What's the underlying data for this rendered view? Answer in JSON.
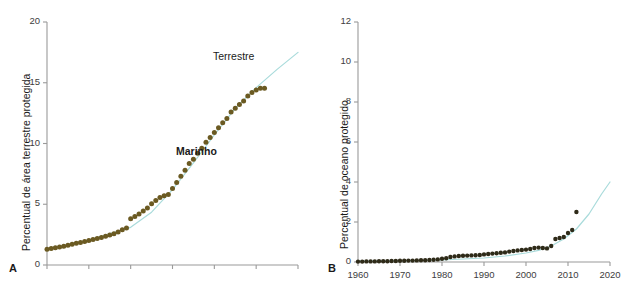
{
  "chart_data": [
    {
      "panel": "A",
      "type": "scatter",
      "title": "",
      "xlabel": "",
      "ylabel": "Percentual de área terrestre protegida",
      "series_label": "Terrestre",
      "xlim": [
        1960,
        2020
      ],
      "ylim": [
        0,
        20
      ],
      "yticks": [
        0,
        5,
        10,
        15,
        20
      ],
      "ytick_labels": [
        "0",
        "5",
        "10",
        "15",
        "20"
      ],
      "xticks": [
        1960,
        1970,
        1980,
        1990,
        2000,
        2010,
        2020
      ],
      "xtick_labels": [
        "",
        "",
        "",
        "",
        "",
        "",
        ""
      ],
      "grid": false,
      "legend": "none",
      "point_color": "#6b5a22",
      "fit_color": "#a9dbdb",
      "x": [
        1960,
        1961,
        1962,
        1963,
        1964,
        1965,
        1966,
        1967,
        1968,
        1969,
        1970,
        1971,
        1972,
        1973,
        1974,
        1975,
        1976,
        1977,
        1978,
        1979,
        1980,
        1981,
        1982,
        1983,
        1984,
        1985,
        1986,
        1987,
        1988,
        1989,
        1990,
        1991,
        1992,
        1993,
        1994,
        1995,
        1996,
        1997,
        1998,
        1999,
        2000,
        2001,
        2002,
        2003,
        2004,
        2005,
        2006,
        2007,
        2008,
        2009,
        2010,
        2011,
        2012
      ],
      "y": [
        1.3,
        1.36,
        1.42,
        1.48,
        1.55,
        1.62,
        1.7,
        1.78,
        1.86,
        1.94,
        2.02,
        2.1,
        2.18,
        2.27,
        2.36,
        2.46,
        2.58,
        2.72,
        2.9,
        3.05,
        3.8,
        4.0,
        4.2,
        4.45,
        4.7,
        5.05,
        5.3,
        5.55,
        5.7,
        5.8,
        6.3,
        6.8,
        7.3,
        7.8,
        8.35,
        8.7,
        9.2,
        9.6,
        10.1,
        10.5,
        10.9,
        11.3,
        11.7,
        12.05,
        12.6,
        12.9,
        13.2,
        13.5,
        13.9,
        14.2,
        14.4,
        14.55,
        14.55
      ],
      "fit_x": [
        1960,
        1970,
        1980,
        1985,
        1990,
        1995,
        2000,
        2005,
        2010,
        2015,
        2020
      ],
      "fit_y": [
        1.35,
        2.05,
        3.1,
        4.35,
        6.2,
        8.4,
        10.7,
        12.9,
        14.6,
        16.1,
        17.5
      ]
    },
    {
      "panel": "B",
      "type": "scatter",
      "title": "",
      "xlabel": "",
      "ylabel": "Percentual de oceano protegido",
      "series_label": "Marinho",
      "xlim": [
        1960,
        2020
      ],
      "ylim": [
        0,
        12
      ],
      "yticks": [
        0,
        2,
        4,
        6,
        8,
        10,
        12
      ],
      "ytick_labels": [
        "0",
        "2",
        "4",
        "6",
        "8",
        "10",
        "12"
      ],
      "xticks": [
        1960,
        1970,
        1980,
        1990,
        2000,
        2010,
        2020
      ],
      "xtick_labels": [
        "1960",
        "1970",
        "1980",
        "1990",
        "2000",
        "2010",
        "2020"
      ],
      "grid": false,
      "legend": "none",
      "point_color": "#2e2a18",
      "fit_color": "#a9dbdb",
      "x": [
        1960,
        1961,
        1962,
        1963,
        1964,
        1965,
        1966,
        1967,
        1968,
        1969,
        1970,
        1971,
        1972,
        1973,
        1974,
        1975,
        1976,
        1977,
        1978,
        1979,
        1980,
        1981,
        1982,
        1983,
        1984,
        1985,
        1986,
        1987,
        1988,
        1989,
        1990,
        1991,
        1992,
        1993,
        1994,
        1995,
        1996,
        1997,
        1998,
        1999,
        2000,
        2001,
        2002,
        2003,
        2004,
        2005,
        2006,
        2007,
        2008,
        2009,
        2010,
        2011,
        2012
      ],
      "y": [
        0.02,
        0.02,
        0.03,
        0.03,
        0.03,
        0.04,
        0.04,
        0.04,
        0.05,
        0.05,
        0.06,
        0.06,
        0.07,
        0.07,
        0.08,
        0.09,
        0.09,
        0.1,
        0.11,
        0.13,
        0.16,
        0.19,
        0.25,
        0.28,
        0.3,
        0.31,
        0.32,
        0.33,
        0.34,
        0.35,
        0.38,
        0.4,
        0.42,
        0.44,
        0.46,
        0.48,
        0.52,
        0.55,
        0.58,
        0.6,
        0.62,
        0.65,
        0.7,
        0.72,
        0.7,
        0.68,
        0.8,
        1.15,
        1.2,
        1.25,
        1.45,
        1.6,
        2.5
      ],
      "fit_x": [
        1960,
        1970,
        1980,
        1990,
        1995,
        2000,
        2003,
        2006,
        2009,
        2012,
        2015,
        2018,
        2020
      ],
      "fit_y": [
        0.04,
        0.06,
        0.1,
        0.2,
        0.3,
        0.45,
        0.58,
        0.8,
        1.15,
        1.65,
        2.4,
        3.4,
        4.0
      ]
    }
  ],
  "panels": {
    "a": {
      "letter": "A"
    },
    "b": {
      "letter": "B"
    }
  }
}
